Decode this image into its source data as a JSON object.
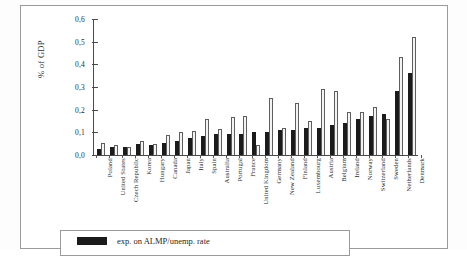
{
  "chart_data": {
    "type": "bar",
    "title": "",
    "xlabel": "",
    "ylabel": "% of GDP",
    "ylim": [
      0.0,
      0.6
    ],
    "ytick_labels": [
      "0,0",
      "0,1",
      "0,2",
      "0,3",
      "0,4",
      "0,5",
      "0,6"
    ],
    "ytick_values": [
      0.0,
      0.1,
      0.2,
      0.3,
      0.4,
      0.5,
      0.6
    ],
    "grid": false,
    "legend_position": "bottom",
    "decimal_separator": ",",
    "categories": [
      "Poland",
      "United States",
      "Czech Republic",
      "Korea",
      "Hungary",
      "Canada",
      "Japan",
      "Italy",
      "Spain",
      "Australia",
      "Portugal",
      "France",
      "United Kingdom",
      "Germany",
      "New Zealand",
      "Finland",
      "Luxembourg",
      "Austria",
      "Belgium",
      "Ireland",
      "Norway",
      "Switzerland",
      "Sweden",
      "Netherlands",
      "Denmark"
    ],
    "series": [
      {
        "name": "exp. on ALMP/unemp. rate",
        "style": "filled-black",
        "color": "#1b1b1b",
        "values": [
          0.025,
          0.035,
          0.035,
          0.047,
          0.045,
          0.053,
          0.064,
          0.073,
          0.083,
          0.091,
          0.091,
          0.091,
          0.101,
          0.101,
          0.111,
          0.111,
          0.12,
          0.121,
          0.131,
          0.14,
          0.161,
          0.171,
          0.181,
          0.282,
          0.361
        ]
      },
      {
        "name": "",
        "style": "open-white",
        "color": "#f3f3f3",
        "values": [
          0.054,
          0.045,
          0.035,
          0.063,
          0.048,
          0.09,
          0.101,
          0.108,
          0.16,
          0.116,
          0.169,
          0.17,
          0.045,
          0.252,
          0.119,
          0.23,
          0.15,
          0.291,
          0.281,
          0.191,
          0.191,
          0.211,
          0.161,
          0.433,
          0.522
        ]
      }
    ]
  },
  "legend": {
    "entries": [
      {
        "label": "exp. on ALMP/unemp. rate",
        "swatch": "filled-black"
      }
    ]
  },
  "colors": {
    "series_a": "#1b1b1b",
    "series_b": "#f3f3f3",
    "series_b_outline": "#5e5e5e",
    "axis": "#4a4a4a",
    "frame": "#9a9a9a",
    "text": "#2b2b2b",
    "background": "#ffffff"
  }
}
